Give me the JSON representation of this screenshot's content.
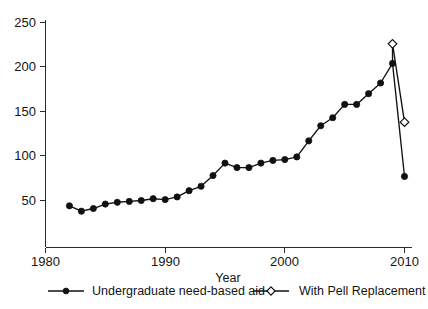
{
  "chart_data": {
    "type": "line",
    "title": "",
    "xlabel": "Year",
    "ylabel": "",
    "xlim": [
      1980,
      2011
    ],
    "ylim": [
      30,
      255
    ],
    "grid": false,
    "legend_position": "bottom",
    "x_ticks": [
      "1980",
      "1990",
      "2000",
      "2010"
    ],
    "x_tick_values": [
      1980,
      1990,
      2000,
      2010
    ],
    "y_ticks": [
      "50",
      "100",
      "150",
      "200",
      "250"
    ],
    "y_tick_values": [
      50,
      100,
      150,
      200,
      250
    ],
    "series": [
      {
        "name": "Undergraduate need-based aid",
        "marker": "filled-circle",
        "x": [
          1982,
          1983,
          1984,
          1985,
          1986,
          1987,
          1988,
          1989,
          1990,
          1991,
          1992,
          1993,
          1994,
          1995,
          1996,
          1997,
          1998,
          1999,
          2000,
          2001,
          2002,
          2003,
          2004,
          2005,
          2006,
          2007,
          2008,
          2009,
          2010
        ],
        "values": [
          44,
          38,
          41,
          46,
          48,
          49,
          50,
          52,
          51,
          54,
          61,
          66,
          78,
          92,
          87,
          87,
          92,
          95,
          96,
          99,
          117,
          134,
          143,
          158,
          158,
          170,
          182,
          204,
          77
        ]
      },
      {
        "name": "With Pell Replacement",
        "marker": "open-diamond",
        "x": [
          2009,
          2010
        ],
        "values": [
          226,
          138
        ]
      }
    ]
  },
  "legend": {
    "items": [
      {
        "label": "Undergraduate need-based aid",
        "marker": "filled-circle"
      },
      {
        "label": "With Pell Replacement",
        "marker": "open-diamond"
      }
    ]
  },
  "axes": {
    "x_title": "Year"
  },
  "colors": {
    "line": "#111111",
    "text": "#141414",
    "background": "#ffffff"
  }
}
